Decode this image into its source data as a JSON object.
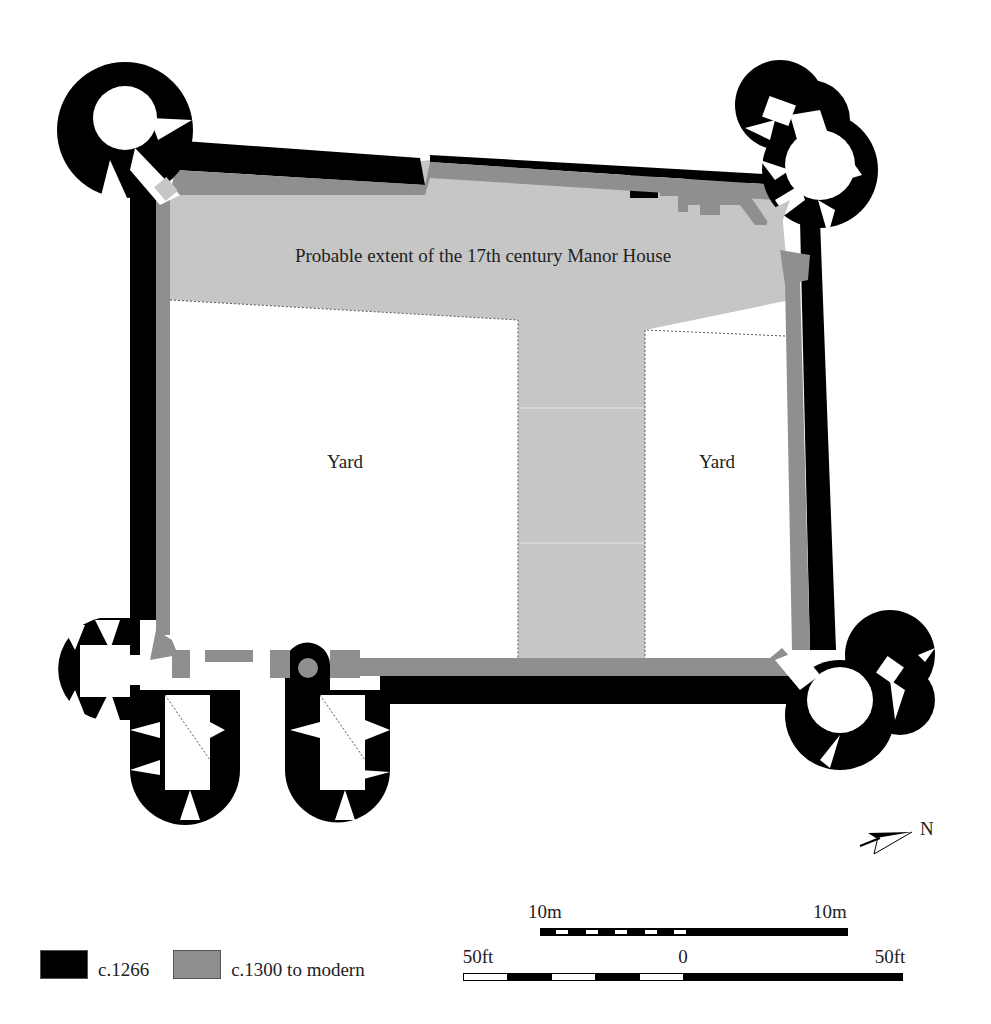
{
  "labels": {
    "manor_house": "Probable extent of the 17th century Manor House",
    "yard_west": "Yard",
    "yard_east": "Yard",
    "north": "N"
  },
  "legend": {
    "items": [
      {
        "label": "c.1266",
        "color": "#000000"
      },
      {
        "label": "c.1300 to modern",
        "color": "#8f8f8f"
      }
    ]
  },
  "scale": {
    "metric": {
      "left_label": "10m",
      "right_label": "10m"
    },
    "imperial": {
      "left_label": "50ft",
      "center_label": "0",
      "right_label": "50ft"
    }
  },
  "colors": {
    "c1266": "#000000",
    "later": "#8f8f8f",
    "manor_fill": "#c8c8c8",
    "yard": "#ffffff"
  }
}
